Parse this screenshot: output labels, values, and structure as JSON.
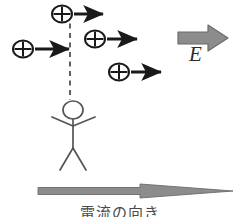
{
  "figure": {
    "background_color": "#ffffff",
    "width": 235,
    "height": 217
  },
  "colors": {
    "stroke_dark": "#1a1a1a",
    "stroke_figure": "#555555",
    "gray_arrow_fill": "#8c8c8c",
    "gray_arrow_stroke": "#6b6b6b",
    "dashed_line": "#3a3a3a",
    "text": "#2b2b2b",
    "caption_text": "#4a4a4a"
  },
  "charges": [
    {
      "name": "charge-top",
      "symbol": "+",
      "cx": 62,
      "cy": 14,
      "rx": 10,
      "ry": 8.5
    },
    {
      "name": "charge-middle-right",
      "symbol": "+",
      "cx": 95,
      "cy": 39,
      "rx": 10,
      "ry": 8.5
    },
    {
      "name": "charge-left",
      "symbol": "+",
      "cx": 23,
      "cy": 49,
      "rx": 10,
      "ry": 8.5
    },
    {
      "name": "charge-lower-right",
      "symbol": "+",
      "cx": 119,
      "cy": 72,
      "rx": 10,
      "ry": 8.5
    }
  ],
  "velocity_arrows": [
    {
      "name": "velocity-arrow-top",
      "x1": 72,
      "y1": 14,
      "x2": 104,
      "y2": 14
    },
    {
      "name": "velocity-arrow-middle-right",
      "x1": 106,
      "y1": 39,
      "x2": 138,
      "y2": 39
    },
    {
      "name": "velocity-arrow-left",
      "x1": 34,
      "y1": 49,
      "x2": 70,
      "y2": 49
    },
    {
      "name": "velocity-arrow-lower-right",
      "x1": 130,
      "y1": 72,
      "x2": 162,
      "y2": 72
    }
  ],
  "dashed_line": {
    "name": "reference-dashed-line",
    "x": 70,
    "y_top": 14,
    "y_bottom": 100
  },
  "stick_figure": {
    "name": "observer-stick-figure",
    "head": {
      "cx": 73,
      "cy": 110,
      "rx": 10,
      "ry": 9
    },
    "body": {
      "x": 73,
      "y_top": 119,
      "y_bottom": 148
    },
    "arm_left": {
      "x1": 73,
      "y1": 126,
      "x2": 52,
      "y2": 117
    },
    "arm_right": {
      "x1": 73,
      "y1": 126,
      "x2": 95,
      "y2": 117
    },
    "leg_left": {
      "x1": 73,
      "y1": 148,
      "x2": 60,
      "y2": 170
    },
    "leg_right": {
      "x1": 73,
      "y1": 148,
      "x2": 86,
      "y2": 170
    }
  },
  "field_arrow": {
    "name": "electric-field-block-arrow",
    "label": "E",
    "label_x": 189,
    "label_y": 55,
    "shaft_x": 178,
    "shaft_y": 32,
    "shaft_w": 30,
    "shaft_h": 12,
    "tip_x": 228
  },
  "current_arrow": {
    "name": "current-direction-arrow",
    "x_start": 38,
    "x_head_start": 140,
    "x_tip": 233,
    "y_center": 191,
    "shaft_half_height": 3.5,
    "head_half_height": 7
  },
  "caption": {
    "name": "current-direction-caption",
    "text": "電流の向き",
    "x": 80,
    "y": 206
  }
}
